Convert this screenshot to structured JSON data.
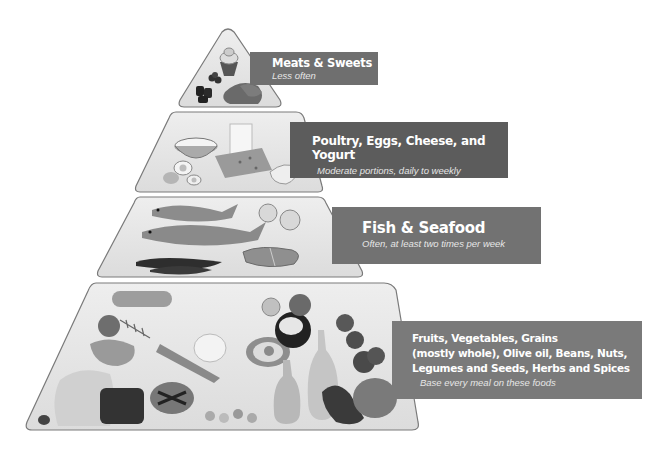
{
  "diagram": {
    "type": "food-pyramid",
    "colors": {
      "tier_fill": "#e3e3e3",
      "tier_stroke": "#7a7a7a",
      "label_bg": "#6f6f6f",
      "label_text": "#ffffff"
    },
    "tiers": [
      {
        "level": 1,
        "title": "Meats & Sweets",
        "subtitle": "Less often",
        "foods": [
          "cupcake",
          "berries",
          "meat"
        ]
      },
      {
        "level": 2,
        "title": "Poultry, Eggs, Cheese, and Yogurt",
        "subtitle": "Moderate portions, daily to weekly",
        "foods": [
          "yogurt bowl",
          "milk",
          "eggs",
          "cheese",
          "poultry"
        ]
      },
      {
        "level": 3,
        "title": "Fish & Seafood",
        "subtitle": "Often, at least two times per week",
        "foods": [
          "fish",
          "shrimp",
          "salmon steaks",
          "mussels"
        ]
      },
      {
        "level": 4,
        "title_lines": [
          "Fruits, Vegetables, Grains",
          "(mostly whole), Olive oil, Beans, Nuts,",
          "Legumes and Seeds, Herbs and Spices"
        ],
        "subtitle": "Base every meal on these foods",
        "foods": [
          "zucchini",
          "apple",
          "peppers",
          "carrots",
          "mushrooms",
          "avocado",
          "coconut",
          "tomatoes",
          "olive oil bottles",
          "eggplant",
          "broccoli",
          "bread",
          "grains",
          "nuts",
          "herbs"
        ]
      }
    ]
  }
}
